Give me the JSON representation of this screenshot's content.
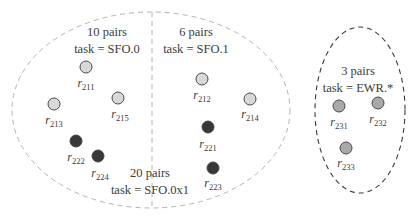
{
  "colors": {
    "background": "#ffffff",
    "outer_ellipse_stroke": "#b4b4b4",
    "right_ellipse_stroke": "#3a3a3a",
    "divider_stroke": "#b4b4b4",
    "node_light_fill": "#d8d8d8",
    "node_dark_fill": "#383838",
    "node_mid_fill": "#a9a9a9",
    "node_stroke": "#4a4a4a",
    "text": "#3c3c3c"
  },
  "groups": [
    {
      "id": "sfo0",
      "line1": "10 pairs",
      "line2": "task = SFO.0",
      "x": 107,
      "y1": 36,
      "y2": 53
    },
    {
      "id": "sfo1",
      "line1": "6 pairs",
      "line2": "task = SFO.1",
      "x": 196,
      "y1": 36,
      "y2": 53
    },
    {
      "id": "sfo0x1",
      "line1": "20 pairs",
      "line2": "task = SFO.0x1",
      "x": 150,
      "y1": 177,
      "y2": 194
    },
    {
      "id": "ewr",
      "line1": "3 pairs",
      "line2": "task = EWR.*",
      "x": 358,
      "y1": 75,
      "y2": 92
    }
  ],
  "nodes": [
    {
      "id": "211",
      "base": "r",
      "sub": "211",
      "cx": 86,
      "cy": 67,
      "shade": "light",
      "lx": 86,
      "ly": 87
    },
    {
      "id": "213",
      "base": "r",
      "sub": "213",
      "cx": 54,
      "cy": 104,
      "shade": "light",
      "lx": 54,
      "ly": 124
    },
    {
      "id": "215",
      "base": "r",
      "sub": "215",
      "cx": 118,
      "cy": 98,
      "shade": "light",
      "lx": 120,
      "ly": 118
    },
    {
      "id": "222",
      "base": "r",
      "sub": "222",
      "cx": 76,
      "cy": 141,
      "shade": "dark",
      "lx": 76,
      "ly": 161
    },
    {
      "id": "224",
      "base": "r",
      "sub": "224",
      "cx": 98,
      "cy": 156,
      "shade": "dark",
      "lx": 100,
      "ly": 177
    },
    {
      "id": "212",
      "base": "r",
      "sub": "212",
      "cx": 202,
      "cy": 79,
      "shade": "light",
      "lx": 202,
      "ly": 99
    },
    {
      "id": "214",
      "base": "r",
      "sub": "214",
      "cx": 250,
      "cy": 99,
      "shade": "light",
      "lx": 250,
      "ly": 118
    },
    {
      "id": "221",
      "base": "r",
      "sub": "221",
      "cx": 208,
      "cy": 127,
      "shade": "dark",
      "lx": 208,
      "ly": 148
    },
    {
      "id": "223",
      "base": "r",
      "sub": "223",
      "cx": 213,
      "cy": 168,
      "shade": "dark",
      "lx": 213,
      "ly": 187
    },
    {
      "id": "231",
      "base": "r",
      "sub": "231",
      "cx": 339,
      "cy": 106,
      "shade": "mid",
      "lx": 339,
      "ly": 126
    },
    {
      "id": "232",
      "base": "r",
      "sub": "232",
      "cx": 378,
      "cy": 103,
      "shade": "mid",
      "lx": 378,
      "ly": 123
    },
    {
      "id": "233",
      "base": "r",
      "sub": "233",
      "cx": 346,
      "cy": 148,
      "shade": "mid",
      "lx": 346,
      "ly": 167
    }
  ]
}
